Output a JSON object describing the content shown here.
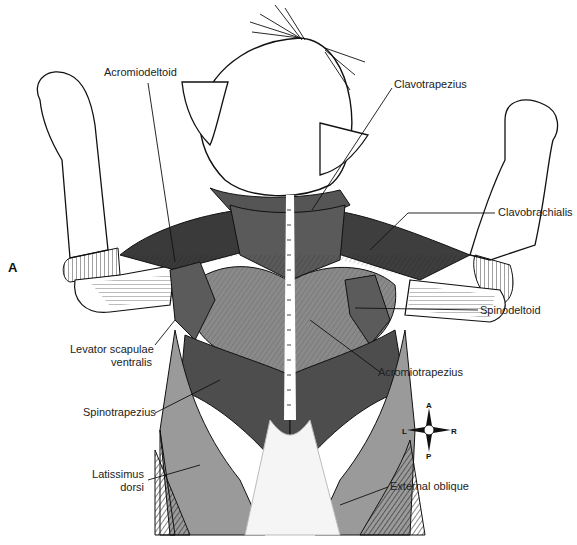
{
  "figure": {
    "panel_letter": "A",
    "labels": {
      "acromiodeltoid": "Acromiodeltoid",
      "clavotrapezius": "Clavotrapezius",
      "clavobrachialis": "Clavobrachialis",
      "spinodeltoid": "Spinodeltoid",
      "levator_line1": "Levator scapulae",
      "levator_line2": "ventralis",
      "acromiotrapezius": "Acromiotrapezius",
      "spinotrapezius": "Spinotrapezius",
      "latissimus_line1": "Latissimus",
      "latissimus_line2": "dorsi",
      "external_oblique": "External oblique"
    },
    "compass": {
      "anterior": "A",
      "posterior": "P",
      "left": "L",
      "right": "R"
    },
    "colors": {
      "dark_muscle": "#4a4a4a",
      "mid_muscle": "#7a7a7a",
      "light_muscle": "#a8a8a8",
      "pale_muscle": "#c4c4c4",
      "outline": "#111111",
      "background": "#ffffff"
    }
  }
}
